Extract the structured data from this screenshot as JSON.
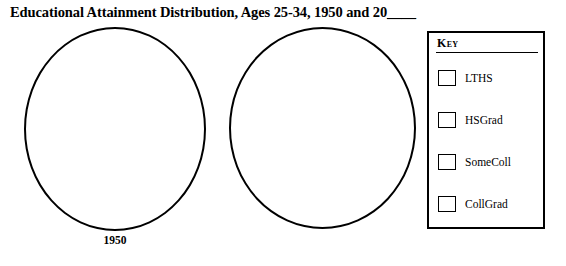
{
  "title": {
    "text": "Educational Attainment Distribution, Ages 25-34, 1950 and 20",
    "blank": "____"
  },
  "charts": [
    {
      "name": "left",
      "caption": "1950",
      "filled": false
    },
    {
      "name": "right",
      "caption": "",
      "filled": false
    }
  ],
  "legend": {
    "heading": "Key",
    "items": [
      {
        "label": "LTHS",
        "swatch_color": "#ffffff"
      },
      {
        "label": "HSGrad",
        "swatch_color": "#ffffff"
      },
      {
        "label": "SomeColl",
        "swatch_color": "#ffffff"
      },
      {
        "label": "CollGrad",
        "swatch_color": "#ffffff"
      }
    ]
  },
  "chart_data": {
    "type": "pie",
    "title": "Educational Attainment Distribution, Ages 25-34, 1950 and 20____",
    "legend_position": "right",
    "legend_title": "Key",
    "categories": [
      "LTHS",
      "HSGrad",
      "SomeColl",
      "CollGrad"
    ],
    "charts": [
      {
        "label": "1950",
        "values": [
          null,
          null,
          null,
          null
        ],
        "note": "blank circle outline - no sectors drawn"
      },
      {
        "label": "",
        "values": [
          null,
          null,
          null,
          null
        ],
        "note": "blank circle outline - no sectors drawn, year to be filled in"
      }
    ],
    "colors": [
      "#ffffff",
      "#ffffff",
      "#ffffff",
      "#ffffff"
    ],
    "stroke_color": "#000000",
    "grid": false
  }
}
